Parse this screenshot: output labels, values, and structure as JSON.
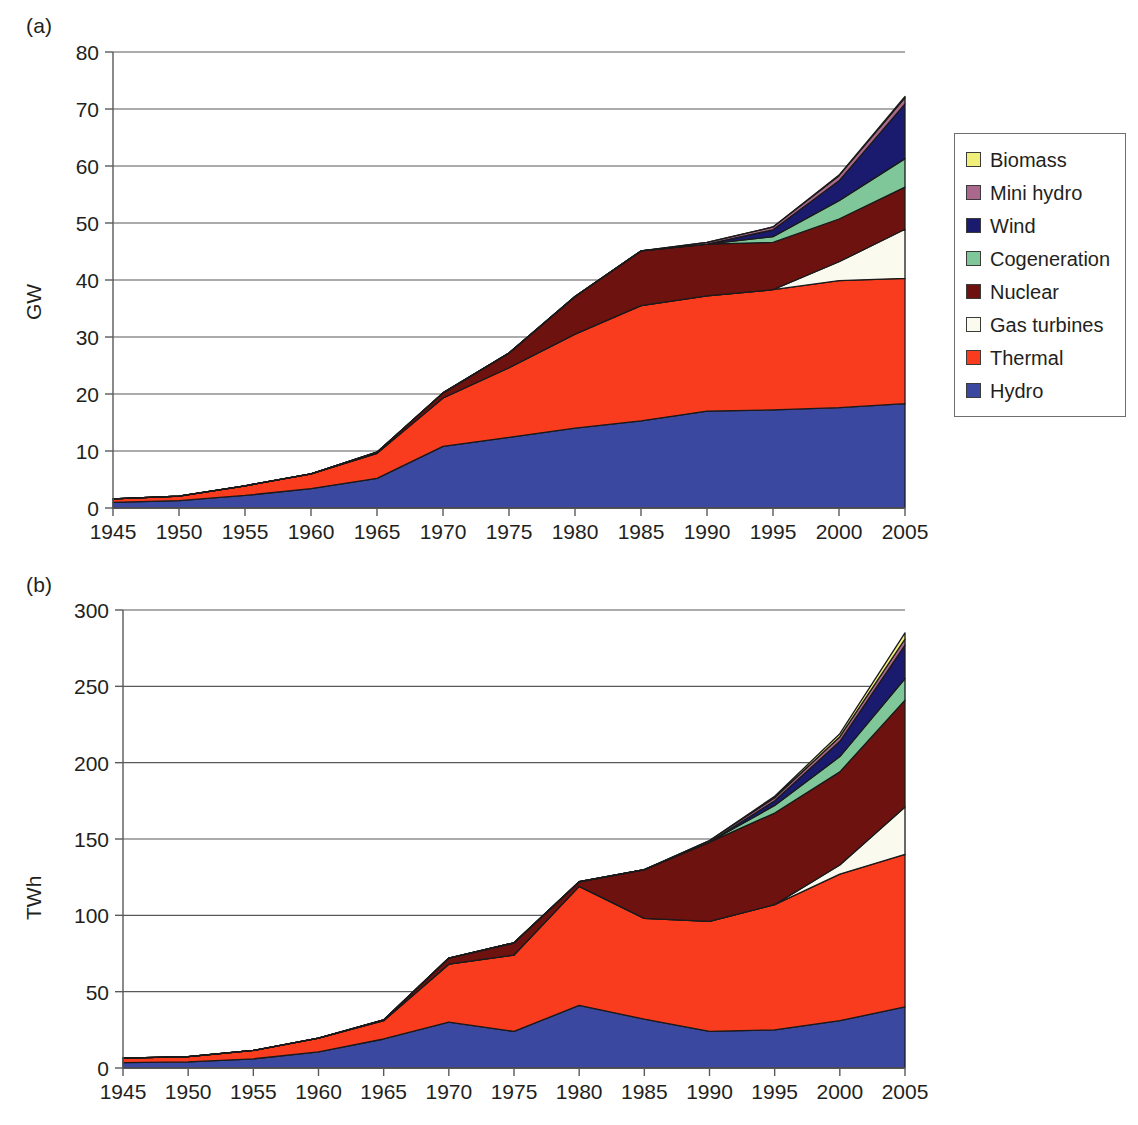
{
  "figure": {
    "panels": [
      {
        "tag": "(a)",
        "ylabel": "GW"
      },
      {
        "tag": "(b)",
        "ylabel": "TWh"
      }
    ]
  },
  "legend": {
    "entries": [
      {
        "label": "Biomass",
        "color": "#EFEF7A"
      },
      {
        "label": "Mini hydro",
        "color": "#A9688C"
      },
      {
        "label": "Wind",
        "color": "#1A1A6E"
      },
      {
        "label": "Cogeneration",
        "color": "#7FC799"
      },
      {
        "label": "Nuclear",
        "color": "#6E1210"
      },
      {
        "label": "Gas turbines",
        "color": "#FBFAEF"
      },
      {
        "label": "Thermal",
        "color": "#FA3C1E"
      },
      {
        "label": "Hydro",
        "color": "#3A48A0"
      }
    ]
  },
  "chart_data": [
    {
      "type": "area",
      "stacked": true,
      "title": "(a)",
      "xlabel": "",
      "ylabel": "GW",
      "ylim": [
        0,
        80
      ],
      "yticks": [
        0,
        10,
        20,
        30,
        40,
        50,
        60,
        70,
        80
      ],
      "xlim": [
        1945,
        2005
      ],
      "grid": true,
      "legend_position": "right",
      "x": [
        1945,
        1950,
        1955,
        1960,
        1965,
        1970,
        1975,
        1980,
        1985,
        1990,
        1995,
        2000,
        2005
      ],
      "categories": [
        "1945",
        "1950",
        "1955",
        "1960",
        "1965",
        "1970",
        "1975",
        "1980",
        "1985",
        "1990",
        "1995",
        "2000",
        "2005"
      ],
      "series": [
        {
          "name": "Hydro",
          "color": "#3A48A0",
          "values": [
            1.0,
            1.3,
            2.2,
            3.4,
            5.2,
            10.8,
            12.4,
            14.0,
            15.3,
            17.0,
            17.2,
            17.6,
            18.3
          ]
        },
        {
          "name": "Thermal",
          "color": "#FA3C1E",
          "values": [
            0.6,
            0.8,
            1.7,
            2.6,
            4.4,
            8.5,
            12.2,
            16.5,
            20.2,
            20.2,
            21.1,
            22.3,
            22.0
          ]
        },
        {
          "name": "Gas turbines",
          "color": "#FBFAEF",
          "values": [
            0,
            0,
            0,
            0,
            0,
            0,
            0,
            0,
            0,
            0,
            0,
            3.3,
            8.6
          ]
        },
        {
          "name": "Nuclear",
          "color": "#6E1210",
          "values": [
            0,
            0,
            0,
            0,
            0.2,
            0.9,
            2.6,
            6.6,
            9.6,
            9.1,
            8.3,
            7.5,
            7.4
          ]
        },
        {
          "name": "Cogeneration",
          "color": "#7FC799",
          "values": [
            0,
            0,
            0,
            0,
            0,
            0,
            0,
            0,
            0,
            0,
            1.0,
            3.2,
            5.0
          ]
        },
        {
          "name": "Wind",
          "color": "#1A1A6E",
          "values": [
            0,
            0,
            0,
            0,
            0,
            0,
            0,
            0,
            0,
            0,
            1.2,
            3.5,
            9.6
          ]
        },
        {
          "name": "Mini hydro",
          "color": "#A9688C",
          "values": [
            0,
            0,
            0,
            0,
            0,
            0,
            0,
            0,
            0,
            0.3,
            0.5,
            0.9,
            1.1
          ]
        },
        {
          "name": "Biomass",
          "color": "#EFEF7A",
          "values": [
            0,
            0,
            0,
            0,
            0,
            0,
            0,
            0,
            0,
            0,
            0,
            0.1,
            0.2
          ]
        }
      ],
      "totals": [
        1.6,
        2.1,
        3.9,
        6.0,
        9.8,
        20.2,
        27.2,
        37.1,
        45.1,
        46.6,
        49.3,
        58.4,
        72.2
      ]
    },
    {
      "type": "area",
      "stacked": true,
      "title": "(b)",
      "xlabel": "",
      "ylabel": "TWh",
      "ylim": [
        0,
        300
      ],
      "yticks": [
        0,
        50,
        100,
        150,
        200,
        250,
        300
      ],
      "xlim": [
        1945,
        2005
      ],
      "grid": true,
      "legend_position": "right",
      "x": [
        1945,
        1950,
        1955,
        1960,
        1965,
        1970,
        1975,
        1980,
        1985,
        1990,
        1995,
        2000,
        2005
      ],
      "categories": [
        "1945",
        "1950",
        "1955",
        "1960",
        "1965",
        "1970",
        "1975",
        "1980",
        "1985",
        "1990",
        "1995",
        "2000",
        "2005"
      ],
      "series": [
        {
          "name": "Hydro",
          "color": "#3A48A0",
          "values": [
            3.5,
            4.0,
            6.0,
            10.5,
            19.0,
            30.0,
            24.0,
            41.0,
            32.0,
            24.0,
            25.0,
            31.0,
            40.0
          ]
        },
        {
          "name": "Thermal",
          "color": "#FA3C1E",
          "values": [
            3.0,
            3.5,
            5.5,
            9.0,
            12.0,
            38.0,
            50.0,
            78.0,
            66.0,
            72.0,
            82.0,
            96.0,
            100.0
          ]
        },
        {
          "name": "Gas turbines",
          "color": "#FBFAEF",
          "values": [
            0,
            0,
            0,
            0,
            0,
            0,
            0,
            0,
            0,
            0,
            0,
            6.0,
            31.0
          ]
        },
        {
          "name": "Nuclear",
          "color": "#6E1210",
          "values": [
            0,
            0,
            0,
            0,
            0.5,
            4.0,
            8.0,
            3.0,
            32.0,
            52.0,
            60.0,
            61.0,
            70.0
          ]
        },
        {
          "name": "Cogeneration",
          "color": "#7FC799",
          "values": [
            0,
            0,
            0,
            0,
            0,
            0,
            0,
            0,
            0,
            0,
            5.0,
            10.0,
            14.0
          ]
        },
        {
          "name": "Wind",
          "color": "#1A1A6E",
          "values": [
            0,
            0,
            0,
            0,
            0,
            0,
            0,
            0,
            0,
            0,
            3.0,
            10.0,
            22.0
          ]
        },
        {
          "name": "Mini hydro",
          "color": "#A9688C",
          "values": [
            0,
            0,
            0,
            0,
            0,
            0,
            0,
            0,
            0,
            1.0,
            2.0,
            3.0,
            4.0
          ]
        },
        {
          "name": "Biomass",
          "color": "#EFEF7A",
          "values": [
            0,
            0,
            0,
            0,
            0,
            0,
            0,
            0,
            0,
            0,
            1.0,
            2.0,
            4.0
          ]
        }
      ],
      "totals": [
        6.5,
        7.5,
        11.5,
        19.5,
        31.5,
        72.0,
        82.0,
        122.0,
        130.0,
        149.0,
        178.0,
        219.0,
        285.0
      ]
    }
  ]
}
